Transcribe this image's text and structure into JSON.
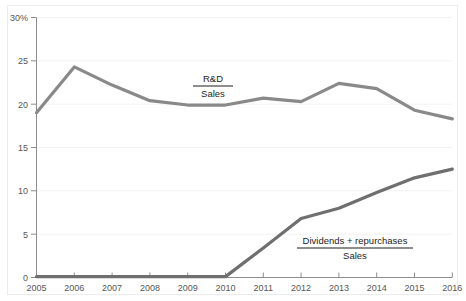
{
  "chart_data": {
    "type": "line",
    "title": "",
    "subtitle": "",
    "xlabel": "",
    "ylabel": "",
    "x": [
      2005,
      2006,
      2007,
      2008,
      2009,
      2010,
      2011,
      2012,
      2013,
      2014,
      2015,
      2016
    ],
    "categories": [
      "2005",
      "2006",
      "2007",
      "2008",
      "2009",
      "2010",
      "2011",
      "2012",
      "2013",
      "2014",
      "2015",
      "2016"
    ],
    "series": [
      {
        "name": "R&D / Sales",
        "label_numerator": "R&D",
        "label_denominator": "Sales",
        "color": "#898989",
        "values": [
          19.0,
          24.3,
          22.2,
          20.4,
          19.9,
          19.9,
          20.7,
          20.3,
          22.4,
          21.8,
          19.3,
          18.3
        ]
      },
      {
        "name": "Dividends + repurchases / Sales",
        "label_numerator": "Dividends + repurchases",
        "label_denominator": "Sales",
        "color": "#6f6f6f",
        "values": [
          0.1,
          0.1,
          0.1,
          0.1,
          0.1,
          0.1,
          3.4,
          6.8,
          8.0,
          9.8,
          11.5,
          12.5
        ]
      }
    ],
    "ylim": [
      0,
      30
    ],
    "xlim": [
      2005,
      2016
    ],
    "yticks": [
      0,
      5,
      10,
      15,
      20,
      25,
      30
    ],
    "ytick_labels": [
      "0",
      "5",
      "10",
      "15",
      "20",
      "25",
      "30%"
    ],
    "xticks": [
      2005,
      2006,
      2007,
      2008,
      2009,
      2010,
      2011,
      2012,
      2013,
      2014,
      2015,
      2016
    ],
    "xtick_labels": [
      "2005",
      "2006",
      "2007",
      "2008",
      "2009",
      "2010",
      "2011",
      "2012",
      "2013",
      "2014",
      "2015",
      "2016"
    ],
    "grid": "horizontal-faint",
    "legend_position": "inline-annotations",
    "annotations": [
      {
        "name": "rd-sales-annotation",
        "numerator": "R&D",
        "denominator": "Sales",
        "x_px": 213,
        "y_px": 84
      },
      {
        "name": "dividends-sales-annotation",
        "numerator": "Dividends + repurchases",
        "denominator": "Sales",
        "x_px": 355,
        "y_px": 246
      }
    ],
    "colors": {
      "axis": "#8e8e8e",
      "grid": "#f1f1f1",
      "tick_text": "#565656",
      "annotation_text": "#1d1d1d",
      "series_1": "#898989",
      "series_2": "#6f6f6f",
      "background": "#ffffff",
      "frame": "#ececec"
    }
  },
  "ytick_labels": {
    "t0": "0",
    "t5": "5",
    "t10": "10",
    "t15": "15",
    "t20": "20",
    "t25": "25",
    "t30": "30%"
  },
  "xtick_labels": {
    "y2005": "2005",
    "y2006": "2006",
    "y2007": "2007",
    "y2008": "2008",
    "y2009": "2009",
    "y2010": "2010",
    "y2011": "2011",
    "y2012": "2012",
    "y2013": "2013",
    "y2014": "2014",
    "y2015": "2015",
    "y2016": "2016"
  },
  "annotations": {
    "rd": {
      "numerator": "R&D",
      "denominator": "Sales"
    },
    "dividends": {
      "numerator": "Dividends + repurchases",
      "denominator": "Sales"
    }
  }
}
